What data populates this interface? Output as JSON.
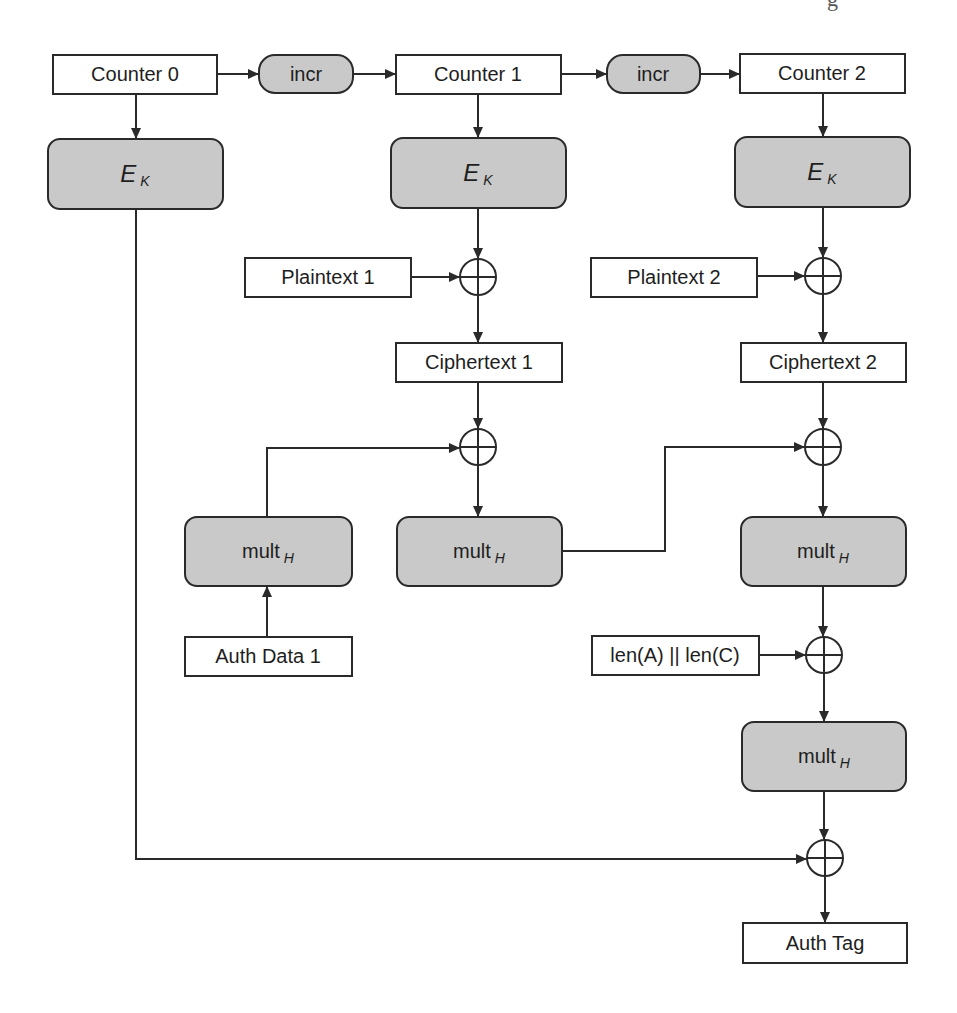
{
  "diagram": {
    "type": "GCM authenticated encryption block diagram",
    "edge_fragment": "g",
    "counters": [
      {
        "id": "counter0",
        "label": "Counter 0"
      },
      {
        "id": "counter1",
        "label": "Counter 1"
      },
      {
        "id": "counter2",
        "label": "Counter 2"
      }
    ],
    "incr": [
      {
        "id": "incr1",
        "label": "incr"
      },
      {
        "id": "incr2",
        "label": "incr"
      }
    ],
    "encrypt": [
      {
        "id": "ek0",
        "label": "E",
        "subscript": "K"
      },
      {
        "id": "ek1",
        "label": "E",
        "subscript": "K"
      },
      {
        "id": "ek2",
        "label": "E",
        "subscript": "K"
      }
    ],
    "plaintexts": [
      {
        "id": "pt1",
        "label": "Plaintext 1"
      },
      {
        "id": "pt2",
        "label": "Plaintext 2"
      }
    ],
    "ciphertexts": [
      {
        "id": "ct1",
        "label": "Ciphertext 1"
      },
      {
        "id": "ct2",
        "label": "Ciphertext 2"
      }
    ],
    "mult": [
      {
        "id": "multA",
        "label": "mult",
        "subscript": "H"
      },
      {
        "id": "mult1",
        "label": "mult",
        "subscript": "H"
      },
      {
        "id": "mult2",
        "label": "mult",
        "subscript": "H"
      },
      {
        "id": "mult3",
        "label": "mult",
        "subscript": "H"
      }
    ],
    "auth_data": {
      "label": "Auth Data 1"
    },
    "lengths": {
      "label": "len(A) || len(C)"
    },
    "auth_tag": {
      "label": "Auth Tag"
    },
    "colors": {
      "gray_fill": "#c9c9c9",
      "stroke": "#2a2a2a",
      "background": "#ffffff"
    }
  }
}
